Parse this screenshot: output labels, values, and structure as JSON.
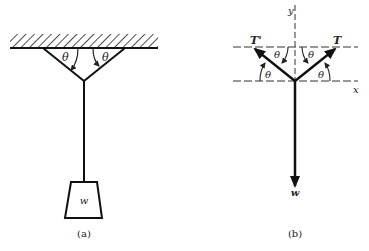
{
  "figure_a": {
    "caption": "(a)",
    "angle_left": "θ",
    "angle_right": "θ",
    "weight_label": "w"
  },
  "figure_b": {
    "caption": "(b)",
    "axis_y": "y",
    "axis_x": "x",
    "tension_left": "T'",
    "tension_right": "T",
    "weight_label": "w",
    "angles": [
      "θ",
      "θ",
      "θ",
      "θ"
    ]
  }
}
